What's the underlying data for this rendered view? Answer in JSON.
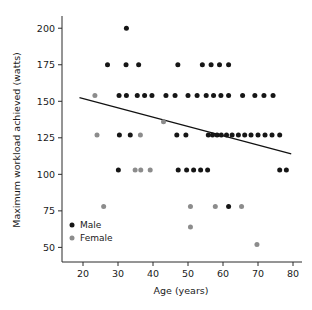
{
  "chart_data": {
    "type": "scatter",
    "title": "",
    "xlabel": "Age (years)",
    "ylabel": "Maximum workload achieved (watts)",
    "xlim": [
      14,
      82
    ],
    "ylim": [
      40,
      207
    ],
    "xticks": [
      20,
      30,
      40,
      50,
      60,
      70,
      80
    ],
    "yticks": [
      50,
      75,
      100,
      125,
      150,
      175,
      200
    ],
    "xtick_labels": [
      "20",
      "30",
      "40",
      "50",
      "60",
      "70",
      "80"
    ],
    "ytick_labels": [
      "50",
      "75",
      "100",
      "125",
      "150",
      "175",
      "200"
    ],
    "grid": false,
    "legend_position": "lower-left-inside",
    "series": [
      {
        "name": "Male",
        "color": "#161616",
        "marker": "circle",
        "points": [
          [
            32.4,
            200
          ],
          [
            27.0,
            175
          ],
          [
            32.3,
            175
          ],
          [
            35.9,
            175
          ],
          [
            47.1,
            175
          ],
          [
            54.1,
            175
          ],
          [
            56.6,
            175
          ],
          [
            59.0,
            175
          ],
          [
            61.6,
            175
          ],
          [
            30.3,
            154
          ],
          [
            32.4,
            154
          ],
          [
            35.5,
            154
          ],
          [
            37.6,
            154
          ],
          [
            39.7,
            154
          ],
          [
            43.7,
            154
          ],
          [
            46.3,
            154
          ],
          [
            50.0,
            154
          ],
          [
            52.6,
            154
          ],
          [
            55.2,
            154
          ],
          [
            57.3,
            154
          ],
          [
            59.4,
            154
          ],
          [
            61.6,
            154
          ],
          [
            65.6,
            154
          ],
          [
            69.1,
            154
          ],
          [
            71.7,
            154
          ],
          [
            74.3,
            154
          ],
          [
            30.4,
            127
          ],
          [
            33.5,
            127
          ],
          [
            46.8,
            127
          ],
          [
            49.4,
            127
          ],
          [
            55.8,
            127
          ],
          [
            57.0,
            127
          ],
          [
            58.3,
            127
          ],
          [
            59.5,
            127
          ],
          [
            61.0,
            127
          ],
          [
            62.6,
            127
          ],
          [
            64.4,
            127
          ],
          [
            66.2,
            127
          ],
          [
            68.0,
            127
          ],
          [
            70.0,
            127
          ],
          [
            72.0,
            127
          ],
          [
            74.0,
            127
          ],
          [
            76.2,
            127
          ],
          [
            30.1,
            103
          ],
          [
            47.2,
            103
          ],
          [
            49.6,
            103
          ],
          [
            51.6,
            103
          ],
          [
            53.6,
            103
          ],
          [
            55.6,
            103
          ],
          [
            76.2,
            103
          ],
          [
            78.1,
            103
          ],
          [
            61.6,
            78
          ]
        ]
      },
      {
        "name": "Female",
        "color": "#8c8c8c",
        "marker": "circle",
        "points": [
          [
            23.4,
            154
          ],
          [
            24.0,
            127
          ],
          [
            36.4,
            127
          ],
          [
            43.0,
            136
          ],
          [
            34.9,
            103
          ],
          [
            36.5,
            103
          ],
          [
            39.2,
            103
          ],
          [
            25.9,
            78
          ],
          [
            50.7,
            78
          ],
          [
            57.8,
            78
          ],
          [
            65.3,
            78
          ],
          [
            50.7,
            64
          ],
          [
            69.7,
            52
          ]
        ]
      }
    ],
    "trend_line": {
      "name": "regression-line",
      "color": "#111111",
      "x_start": 19.0,
      "y_start": 152.5,
      "x_end": 79.5,
      "y_end": 114.0
    }
  },
  "legend": {
    "items": [
      {
        "label": "Male",
        "color": "#161616"
      },
      {
        "label": "Female",
        "color": "#8c8c8c"
      }
    ]
  }
}
